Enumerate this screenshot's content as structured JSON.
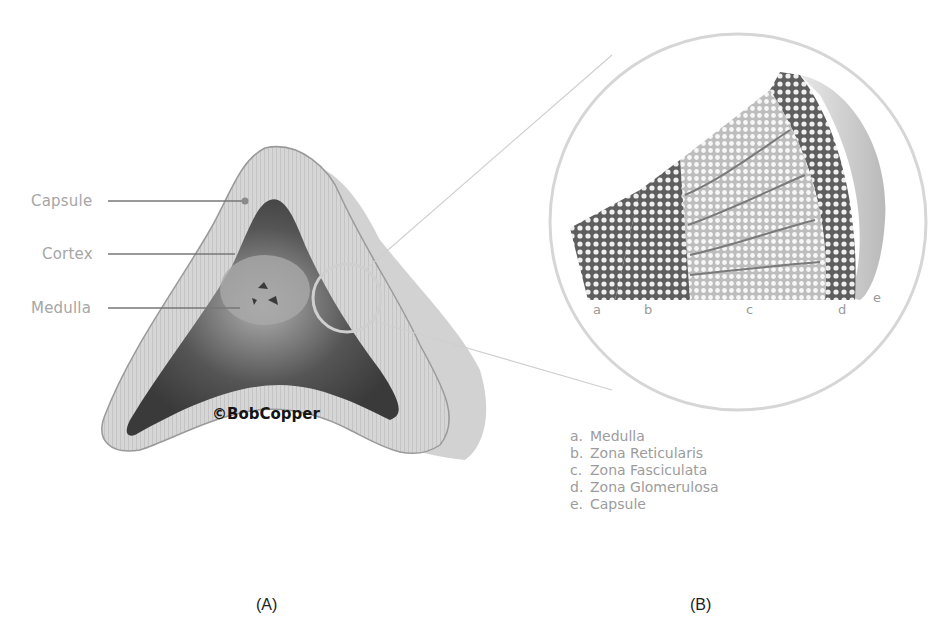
{
  "figure": {
    "panel_a": {
      "caption": "(A)",
      "labels": {
        "capsule": "Capsule",
        "cortex": "Cortex",
        "medulla": "Medulla"
      },
      "watermark": "©BobCopper"
    },
    "panel_b": {
      "caption": "(B)",
      "zone_markers": [
        "a",
        "b",
        "c",
        "d",
        "e"
      ],
      "legend": [
        {
          "key": "a.",
          "text": "Medulla"
        },
        {
          "key": "b.",
          "text": "Zona Reticularis"
        },
        {
          "key": "c.",
          "text": "Zona Fasciculata"
        },
        {
          "key": "d.",
          "text": "Zona Glomerulosa"
        },
        {
          "key": "e.",
          "text": "Capsule"
        }
      ]
    },
    "colors": {
      "label_text": "#a6a6a6",
      "leader_line": "#777777",
      "magnifier_ring": "#cfcfcf"
    }
  }
}
